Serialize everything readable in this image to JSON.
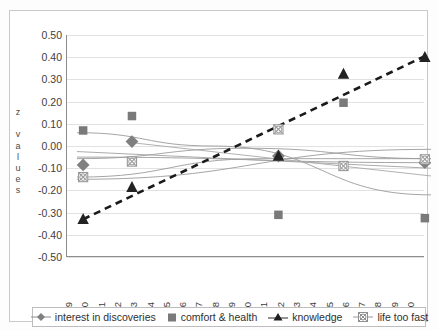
{
  "chart_data": {
    "type": "scatter",
    "title": "",
    "xlabel": "",
    "ylabel": "z values",
    "ylabel_letters": [
      "z",
      "",
      "v",
      "a",
      "l",
      "u",
      "e",
      "s"
    ],
    "ylim": [
      -0.5,
      0.5
    ],
    "ytick_labels": [
      "0.50",
      "0.40",
      "0.30",
      "0.20",
      "0.10",
      "0.00",
      "-0.10",
      "-0.20",
      "-0.30",
      "-0.40",
      "-0.50"
    ],
    "ytick_values": [
      0.5,
      0.4,
      0.3,
      0.2,
      0.1,
      0.0,
      -0.1,
      -0.2,
      -0.3,
      -0.4,
      -0.5
    ],
    "grid": true,
    "legend_position": "bottom",
    "categories": [
      "1989",
      "1990",
      "1991",
      "1992",
      "1993",
      "1994",
      "1995",
      "1996",
      "1997",
      "1998",
      "1999",
      "2000",
      "2001",
      "2002",
      "2003",
      "2004",
      "2005",
      "2006",
      "2007",
      "2008",
      "2009",
      "2010"
    ],
    "series": [
      {
        "name": "interest in discoveries",
        "marker": "diamond",
        "color": "#808080",
        "x": [
          1989,
          1992,
          2001,
          2010
        ],
        "values": [
          -0.04,
          0.065,
          0.0,
          -0.03
        ],
        "trendline": "curve"
      },
      {
        "name": "comfort & health",
        "marker": "square",
        "color": "#7a7a7a",
        "x": [
          1989,
          1992,
          2001,
          2005,
          2010
        ],
        "values": [
          0.115,
          0.18,
          -0.265,
          0.24,
          -0.28
        ],
        "trendline": "curve"
      },
      {
        "name": "knowledge",
        "marker": "triangle",
        "color": "#222222",
        "x": [
          1989,
          1992,
          2001,
          2005,
          2010
        ],
        "values": [
          -0.285,
          -0.14,
          0.0,
          0.37,
          0.445
        ],
        "trendline": "dashed-linear"
      },
      {
        "name": "life too fast",
        "marker": "circle-x",
        "color": "#9a9a9a",
        "x": [
          1989,
          1992,
          2001,
          2005,
          2010
        ],
        "values": [
          -0.095,
          -0.025,
          0.12,
          -0.045,
          -0.015
        ],
        "trendline": "curve"
      }
    ]
  },
  "legend": {
    "items": [
      {
        "label": "interest in discoveries",
        "marker": "diamond-line-icon"
      },
      {
        "label": "comfort & health",
        "marker": "square-icon"
      },
      {
        "label": "knowledge",
        "marker": "triangle-line-icon"
      },
      {
        "label": "life too fast",
        "marker": "circle-x-line-icon"
      }
    ]
  }
}
